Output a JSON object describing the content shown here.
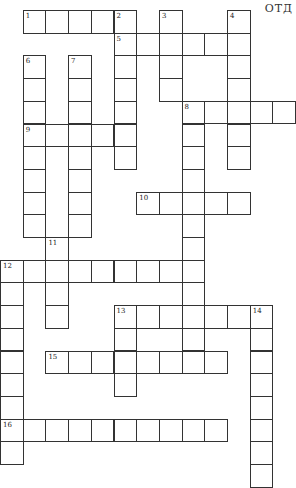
{
  "corner_label": "ОТД",
  "grid": {
    "cell_size": 22.7,
    "origin_x": 0,
    "origin_y": 10,
    "border_color": "#333333"
  },
  "words": [
    {
      "number": "1",
      "dir": "across",
      "row": 0,
      "col": 1,
      "length": 5
    },
    {
      "number": "2",
      "dir": "down",
      "row": 0,
      "col": 5,
      "length": 7
    },
    {
      "number": "3",
      "dir": "down",
      "row": 0,
      "col": 7,
      "length": 4
    },
    {
      "number": "4",
      "dir": "down",
      "row": 0,
      "col": 10,
      "length": 7
    },
    {
      "number": "5",
      "dir": "across",
      "row": 1,
      "col": 5,
      "length": 6
    },
    {
      "number": "6",
      "dir": "down",
      "row": 2,
      "col": 1,
      "length": 8
    },
    {
      "number": "7",
      "dir": "down",
      "row": 2,
      "col": 3,
      "length": 8
    },
    {
      "number": "8",
      "dir": "across",
      "row": 4,
      "col": 8,
      "length": 5
    },
    {
      "number": "8",
      "dir": "down",
      "row": 4,
      "col": 8,
      "length": 12
    },
    {
      "number": "9",
      "dir": "across",
      "row": 5,
      "col": 1,
      "length": 5
    },
    {
      "number": "10",
      "dir": "across",
      "row": 8,
      "col": 6,
      "length": 5
    },
    {
      "number": "11",
      "dir": "down",
      "row": 10,
      "col": 2,
      "length": 4
    },
    {
      "number": "12",
      "dir": "across",
      "row": 11,
      "col": 0,
      "length": 9
    },
    {
      "number": "12",
      "dir": "down",
      "row": 11,
      "col": 0,
      "length": 9
    },
    {
      "number": "13",
      "dir": "across",
      "row": 13,
      "col": 5,
      "length": 7
    },
    {
      "number": "13",
      "dir": "down",
      "row": 13,
      "col": 5,
      "length": 4
    },
    {
      "number": "14",
      "dir": "down",
      "row": 13,
      "col": 11,
      "length": 8
    },
    {
      "number": "15",
      "dir": "across",
      "row": 15,
      "col": 2,
      "length": 8
    },
    {
      "number": "16",
      "dir": "across",
      "row": 18,
      "col": 0,
      "length": 10
    }
  ]
}
